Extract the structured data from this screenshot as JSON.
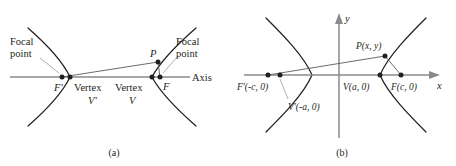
{
  "figure": {
    "background_color": "#ffffff",
    "ink_color": "#231f20",
    "axis_color": "#8a8a8a",
    "leader_color": "#9a9a9a"
  },
  "panel_a": {
    "caption": "(a)",
    "labels": {
      "focal_point_left_line1": "Focal",
      "focal_point_left_line2": "point",
      "focal_point_right_line1": "Focal",
      "focal_point_right_line2": "point",
      "focus_left": "F'",
      "focus_right": "F",
      "vertex_left_word": "Vertex",
      "vertex_left_symbol": "V'",
      "vertex_right_word": "Vertex",
      "vertex_right_symbol": "V",
      "point_p": "P",
      "axis": "Axis"
    }
  },
  "panel_b": {
    "caption": "(b)",
    "labels": {
      "y_axis": "y",
      "x_axis": "x",
      "point_p": "P(x, y)",
      "focus_left": "F'(-c, 0)",
      "vertex_left": "V'(-a, 0)",
      "vertex_right": "V(a, 0)",
      "focus_right": "F(c, 0)"
    }
  }
}
